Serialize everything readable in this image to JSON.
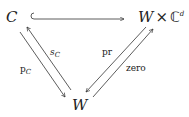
{
  "diagram": {
    "type": "commutative-diagram",
    "nodes": {
      "C": {
        "label": "C"
      },
      "WxCd": {
        "base": "W",
        "times": "×",
        "field": "ℂ",
        "exponent": "d"
      },
      "W": {
        "label": "W"
      }
    },
    "edges": [
      {
        "from": "C",
        "to": "WxCd",
        "style": "hook-inclusion",
        "label": ""
      },
      {
        "from": "W",
        "to": "C",
        "label_base": "s",
        "label_sub": "C"
      },
      {
        "from": "C",
        "to": "W",
        "label_base": "p",
        "label_sub": "C"
      },
      {
        "from": "WxCd",
        "to": "W",
        "label": "pr"
      },
      {
        "from": "W",
        "to": "WxCd",
        "label": "zero"
      }
    ]
  }
}
